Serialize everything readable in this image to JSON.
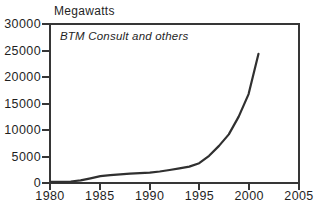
{
  "colors": {
    "line": "#303030",
    "axis": "#363636",
    "text": "#1f1f1f",
    "background": "#ffffff"
  },
  "chart_data": {
    "type": "line",
    "title": "Megawatts",
    "annotation": "BTM Consult and others",
    "xlabel": "",
    "ylabel": "Megawatts",
    "xlim": [
      1980,
      2005
    ],
    "ylim": [
      0,
      30000
    ],
    "grid": false,
    "legend": "none",
    "x_ticks": {
      "values": [
        1980,
        1985,
        1990,
        1995,
        2000,
        2005
      ],
      "labels": [
        "1980",
        "1985",
        "1990",
        "1995",
        "2000",
        "2005"
      ]
    },
    "y_ticks": {
      "values": [
        0,
        5000,
        10000,
        15000,
        20000,
        25000,
        30000
      ],
      "labels": [
        "0",
        "5000",
        "10000",
        "15000",
        "20000",
        "25000",
        "30000"
      ]
    },
    "series": [
      {
        "name": "World wind generating capacity (megawatts)",
        "x": [
          1980,
          1981,
          1982,
          1983,
          1984,
          1985,
          1986,
          1987,
          1988,
          1989,
          1990,
          1991,
          1992,
          1993,
          1994,
          1995,
          1996,
          1997,
          1998,
          1999,
          2000,
          2001
        ],
        "y": [
          10,
          30,
          100,
          300,
          700,
          1100,
          1300,
          1450,
          1580,
          1700,
          1800,
          2000,
          2300,
          2600,
          2950,
          3600,
          5000,
          6900,
          9100,
          12500,
          16800,
          24500
        ]
      }
    ]
  }
}
